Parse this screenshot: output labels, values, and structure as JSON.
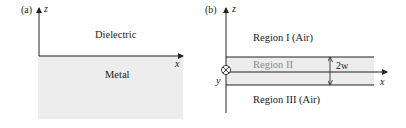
{
  "panel_a": {
    "label": "(a)",
    "axis_z": "z",
    "axis_x": "x",
    "upper_region": "Dielectric",
    "lower_region": "Metal",
    "colors": {
      "metal_fill": "#ededed",
      "line": "#222222"
    }
  },
  "panel_b": {
    "label": "(b)",
    "axis_z": "z",
    "axis_x": "x",
    "axis_y": "y",
    "region_1": "Region I (Air)",
    "region_2": "Region II",
    "region_3": "Region III (Air)",
    "thickness_label": "2w",
    "colors": {
      "slab_fill": "#ececec",
      "region_2_text": "#8a8a8a",
      "line": "#222222"
    }
  }
}
